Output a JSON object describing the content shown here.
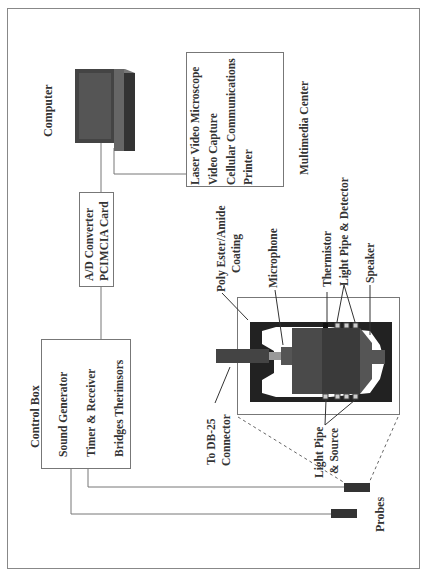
{
  "diagram": {
    "computer": {
      "label": "Computer"
    },
    "multimedia_center": {
      "label": "Multimedia Center",
      "items": [
        "Laser Video Microscope",
        "Video Capture",
        "Cellular Communications",
        "Printer"
      ]
    },
    "ad_converter": {
      "lines": [
        "A/D Converter",
        "PCIMCIA Card"
      ]
    },
    "control_box": {
      "label": "Control Box",
      "items": [
        "Sound Generator",
        "Timer & Receiver",
        "Bridges Therimsors"
      ]
    },
    "probe_detail": {
      "labels": {
        "coating": [
          "Poly Ester/Amide",
          "Coating"
        ],
        "microphone": "Microphone",
        "thermistor": "Thermistor",
        "light_pipe_detector": "Light Pipe & Detector",
        "speaker": "Speaker",
        "db25": [
          "To DB-25",
          "Connector"
        ],
        "light_pipe_source": [
          "Light Pipe",
          "& Source"
        ]
      }
    },
    "probes": {
      "label": "Probes"
    }
  }
}
